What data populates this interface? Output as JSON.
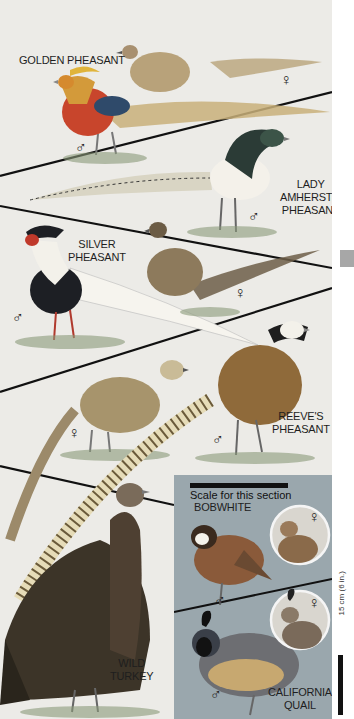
{
  "plate": {
    "sections": [
      {
        "name": "GOLDEN PHEASANT",
        "male": "♂",
        "female": "♀"
      },
      {
        "name_lines": [
          "LADY",
          "AMHERST'S",
          "PHEASANT"
        ],
        "male": "♂"
      },
      {
        "name_lines": [
          "SILVER",
          "PHEASANT"
        ],
        "male": "♂",
        "female": "♀"
      },
      {
        "name_lines": [
          "REEVE'S",
          "PHEASANT"
        ],
        "male": "♂",
        "female": "♀"
      },
      {
        "name_lines": [
          "WILD",
          "TURKEY"
        ]
      }
    ],
    "quail_panel": {
      "scale_text": "Scale for this section",
      "bobwhite": {
        "name": "BOBWHITE",
        "male": "♂",
        "female": "♀"
      },
      "california_quail": {
        "name_lines": [
          "CALIFORNIA",
          "QUAIL"
        ],
        "male": "♂",
        "female": "♀"
      }
    },
    "scale_label": "15 cm (6 in.)"
  },
  "colors": {
    "background": "#ecebe7",
    "quail_panel": "#9aa7ad",
    "golden_male_body": "#c8452c",
    "golden_crest": "#e0b43a",
    "grass": "#8a9a7a",
    "divider": "#111111",
    "side_tab": "#a7a7a7"
  }
}
